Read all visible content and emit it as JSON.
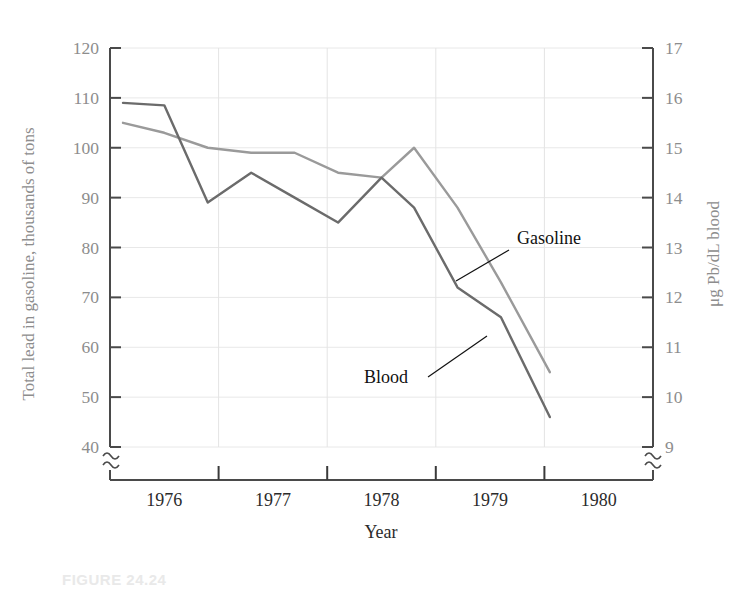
{
  "figure": {
    "caption": "FIGURE 24.24"
  },
  "chart_data": {
    "type": "line",
    "title": "",
    "xlabel": "Year",
    "ylabel": "Total lead in gasoline, thousands of tons",
    "y2label": "μg Pb/dL blood",
    "grid": true,
    "legend_position": "inline-annotations",
    "axis_break_left": true,
    "axis_break_right": true,
    "xlim": [
      1975.5,
      1980.5
    ],
    "x_tick_values": [
      1976.5,
      1977.5,
      1978.5,
      1979.5
    ],
    "x_tick_labels": [
      "1976",
      "1977",
      "1978",
      "1979",
      "1980"
    ],
    "x_label_positions": [
      1976,
      1977,
      1978,
      1979,
      1980
    ],
    "ylim": [
      40,
      120
    ],
    "y_ticks": [
      40,
      50,
      60,
      70,
      80,
      90,
      100,
      110,
      120
    ],
    "y_tick_labels": [
      "40",
      "50",
      "60",
      "70",
      "80",
      "90",
      "100",
      "110",
      "120"
    ],
    "y2lim": [
      9,
      17
    ],
    "y2_ticks": [
      9,
      10,
      11,
      12,
      13,
      14,
      15,
      16,
      17
    ],
    "y2_tick_labels": [
      "9",
      "10",
      "11",
      "12",
      "13",
      "14",
      "15",
      "16",
      "17"
    ],
    "x": [
      1975.62,
      1976.0,
      1976.4,
      1976.8,
      1977.2,
      1977.6,
      1978.0,
      1978.3,
      1978.7,
      1979.1,
      1979.55
    ],
    "series": [
      {
        "name": "Gasoline",
        "color": "#9a9a9a",
        "axis": "left",
        "values": [
          105,
          103,
          100,
          99,
          99,
          95,
          94,
          100,
          88,
          73,
          55
        ]
      },
      {
        "name": "Blood",
        "color": "#6b6b6b",
        "axis": "left",
        "values": [
          109,
          108.5,
          89,
          95,
          90,
          85,
          94,
          88,
          72,
          66,
          46
        ]
      }
    ],
    "annotations": [
      {
        "text": "Gasoline",
        "label_x": 517,
        "label_y": 244,
        "leader_from_x": 509,
        "leader_from_y": 250,
        "leader_to_x": 456,
        "leader_to_y": 281
      },
      {
        "text": "Blood",
        "label_x": 364,
        "label_y": 383,
        "leader_from_x": 428,
        "leader_from_y": 377,
        "leader_to_x": 487,
        "leader_to_y": 336
      }
    ]
  }
}
